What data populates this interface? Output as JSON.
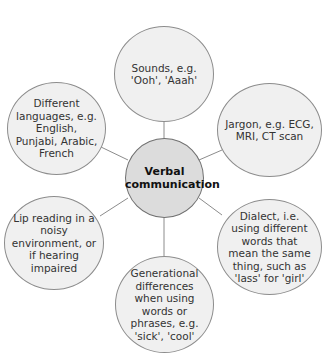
{
  "diagram": {
    "center": {
      "label": "Verbal communication"
    },
    "nodes": [
      {
        "id": "sounds",
        "label": "Sounds, e.g. 'Ooh', 'Aaah'"
      },
      {
        "id": "jargon",
        "label": "Jargon, e.g. ECG, MRI, CT scan"
      },
      {
        "id": "dialect",
        "label": "Dialect, i.e. using different words that mean the same thing, such as 'lass' for 'girl'"
      },
      {
        "id": "generational",
        "label": "Generational differences when using words or phrases, e.g. 'sick', 'cool'"
      },
      {
        "id": "lip-reading",
        "label": "Lip reading in a noisy environment, or if hearing impaired"
      },
      {
        "id": "languages",
        "label": "Different languages, e.g. English, Punjabi, Arabic, French"
      }
    ],
    "colors": {
      "node_fill": "#f0f0f0",
      "center_fill": "#dcdcdc",
      "outline": "#8c8c8c",
      "text": "#333333"
    }
  }
}
